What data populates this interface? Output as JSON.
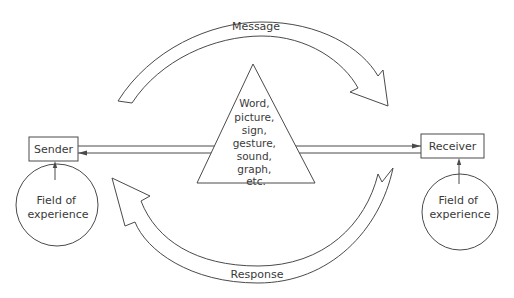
{
  "diagram": {
    "type": "communication-model",
    "sender": {
      "label": "Sender",
      "field": [
        "Field of",
        "experience"
      ]
    },
    "receiver": {
      "label": "Receiver",
      "field": [
        "Field of",
        "experience"
      ]
    },
    "message_arrow": {
      "label": "Message",
      "direction": "sender-to-receiver"
    },
    "response_arrow": {
      "label": "Response",
      "direction": "receiver-to-sender"
    },
    "channel": {
      "lines": [
        "Sender → Receiver",
        "Receiver → Sender"
      ],
      "media": [
        "Word,",
        "picture,",
        "sign,",
        "gesture,",
        "sound,",
        "graph,",
        "etc."
      ]
    },
    "colors": {
      "line": "#4a4a4a",
      "text": "#3a3a3a",
      "background": "#ffffff"
    }
  }
}
